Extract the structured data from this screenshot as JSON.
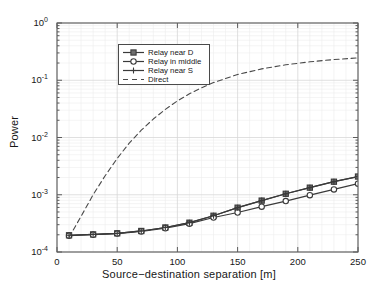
{
  "chart_data": {
    "type": "line",
    "title": "",
    "xlabel": "Source−destination separation [m]",
    "ylabel": "Power",
    "xscale": "linear",
    "yscale": "log",
    "xlim": [
      0,
      250
    ],
    "ylim": [
      0.0001,
      1
    ],
    "grid": true,
    "grid_minor": true,
    "legend_position": "upper-left-inside",
    "xticks": [
      "0",
      "50",
      "100",
      "150",
      "200",
      "250"
    ],
    "xtick_values": [
      0,
      50,
      100,
      150,
      200,
      250
    ],
    "ytick_labels": [
      "10",
      "10",
      "10",
      "10",
      "10"
    ],
    "ytick_exponents": [
      "0",
      "-1",
      "-2",
      "-3",
      "-4"
    ],
    "ytick_values": [
      1,
      0.1,
      0.01,
      0.001,
      0.0001
    ],
    "x": [
      10,
      30,
      50,
      70,
      90,
      110,
      130,
      150,
      170,
      190,
      210,
      230,
      250
    ],
    "series": [
      {
        "name": "Relay near D",
        "marker": "square-filled",
        "linestyle": "solid",
        "color": "#3a3a3a",
        "values": [
          0.000196,
          0.000203,
          0.000212,
          0.000233,
          0.000268,
          0.000325,
          0.00043,
          0.000595,
          0.00079,
          0.00104,
          0.00133,
          0.00169,
          0.00208
        ]
      },
      {
        "name": "Relay in middle",
        "marker": "circle-open",
        "linestyle": "solid",
        "color": "#3a3a3a",
        "values": [
          0.000193,
          0.0002,
          0.00021,
          0.000228,
          0.00026,
          0.000313,
          0.0004,
          0.00049,
          0.00062,
          0.000775,
          0.000985,
          0.00124,
          0.00156
        ]
      },
      {
        "name": "Relay near S",
        "marker": "plus",
        "linestyle": "solid",
        "color": "#3a3a3a",
        "values": [
          0.000196,
          0.000203,
          0.000212,
          0.000233,
          0.000268,
          0.000325,
          0.00043,
          0.000595,
          0.00079,
          0.00104,
          0.00133,
          0.00169,
          0.00208
        ]
      },
      {
        "name": "Direct",
        "marker": "none",
        "linestyle": "dashed",
        "color": "#4a4a4a",
        "x": [
          10,
          20,
          30,
          40,
          50,
          60,
          70,
          80,
          90,
          100,
          110,
          120,
          130,
          150,
          170,
          190,
          210,
          230,
          250
        ],
        "values": [
          0.00018,
          0.00042,
          0.001,
          0.00215,
          0.0043,
          0.008,
          0.0134,
          0.021,
          0.031,
          0.0435,
          0.058,
          0.074,
          0.091,
          0.126,
          0.158,
          0.186,
          0.21,
          0.23,
          0.246
        ]
      }
    ]
  },
  "legend": {
    "entries": [
      {
        "label": "Relay near D"
      },
      {
        "label": "Relay in middle"
      },
      {
        "label": "Relay near S"
      },
      {
        "label": "Direct"
      }
    ]
  },
  "axes": {
    "x_label": "Source−destination separation [m]",
    "y_label": "Power"
  },
  "colors": {
    "line": "#3a3a3a",
    "dashed_line": "#4a4a4a",
    "axis": "#5c5c5c",
    "grid_major": "#d8d8d8",
    "grid_minor": "#ececec",
    "text": "#171717",
    "background": "#ffffff"
  }
}
